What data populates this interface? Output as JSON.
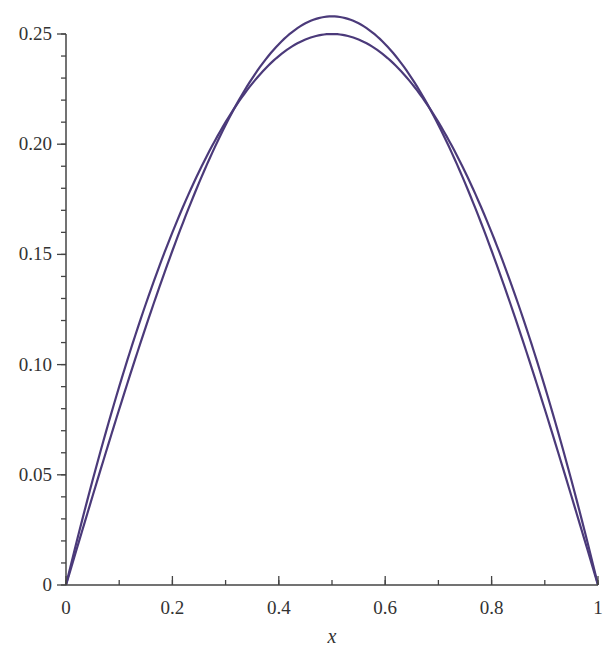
{
  "chart_data": {
    "type": "line",
    "title": "",
    "xlabel": "x",
    "ylabel": "",
    "xlim": [
      0,
      1
    ],
    "ylim": [
      0,
      0.25
    ],
    "grid": false,
    "legend": null,
    "x_ticks": [
      0,
      0.2,
      0.4,
      0.6,
      0.8,
      1
    ],
    "x_tick_labels": [
      "0",
      "0.2",
      "0.4",
      "0.6",
      "0.8",
      "1"
    ],
    "x_minor_step": 0.1,
    "y_ticks": [
      0,
      0.05,
      0.1,
      0.15,
      0.2,
      0.25
    ],
    "y_tick_labels": [
      "0",
      "0.05",
      "0.10",
      "0.15",
      "0.20",
      "0.25"
    ],
    "y_minor_step": 0.01,
    "line_color": "#4b3a7a",
    "series": [
      {
        "name": "x(1-x)",
        "x": [
          0,
          0.1,
          0.2,
          0.3,
          0.4,
          0.5,
          0.6,
          0.7,
          0.8,
          0.9,
          1.0
        ],
        "values": [
          0,
          0.09,
          0.16,
          0.21,
          0.24,
          0.25,
          0.24,
          0.21,
          0.16,
          0.09,
          0
        ]
      },
      {
        "name": "(8/pi^3) sin(pi x)",
        "x": [
          0,
          0.1,
          0.2,
          0.3,
          0.4,
          0.5,
          0.6,
          0.7,
          0.8,
          0.9,
          1.0
        ],
        "values": [
          0,
          0.0798,
          0.1517,
          0.2087,
          0.2454,
          0.258,
          0.2454,
          0.2087,
          0.1517,
          0.0798,
          0
        ]
      }
    ]
  }
}
